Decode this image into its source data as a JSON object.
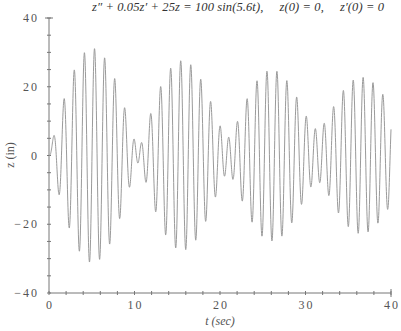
{
  "chart_data": {
    "type": "line",
    "xlabel": "t (sec)",
    "ylabel": "z (in)",
    "xlim": [
      0,
      40
    ],
    "ylim": [
      -40,
      40
    ],
    "x_ticks": [
      0,
      10,
      20,
      30,
      40
    ],
    "y_ticks": [
      -40,
      -20,
      0,
      20,
      40
    ],
    "x_minor_step": 2,
    "y_minor_step": 5,
    "grid": false,
    "legend": null,
    "series": [
      {
        "name": "z(t)",
        "color": "#9a9a9a",
        "model": {
          "equation": "z'' + 0.05z' + 25z = 100 sin(5.6t)",
          "damping": 0.05,
          "stiffness": 25,
          "force_amplitude": 100,
          "force_frequency": 5.6,
          "z0": 0,
          "dz0": 0,
          "t_start": 0,
          "t_end": 40,
          "dt": 0.02
        },
        "approx_peak_envelope": [
          {
            "t": 0,
            "amp": 0
          },
          {
            "t": 5.2,
            "amp": 31
          },
          {
            "t": 10.5,
            "amp": 3
          },
          {
            "t": 15.7,
            "amp": 27
          },
          {
            "t": 21.0,
            "amp": 5
          },
          {
            "t": 26.2,
            "amp": 24
          },
          {
            "t": 31.4,
            "amp": 7
          },
          {
            "t": 36.6,
            "amp": 22
          },
          {
            "t": 40,
            "amp": 17
          }
        ]
      }
    ]
  },
  "title_parts": {
    "equation": "z″ + 0.05z′ + 25z = 100 sin(5.6t),",
    "ic1": "z(0) = 0,",
    "ic2": "z′(0) = 0"
  }
}
